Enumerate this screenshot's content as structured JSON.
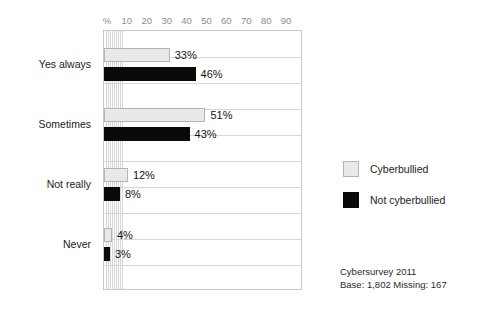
{
  "chart_data": {
    "type": "bar",
    "orientation": "horizontal",
    "title": "",
    "xlabel": "%",
    "ylabel": "",
    "xlim": [
      0,
      100
    ],
    "xticks": [
      "%",
      "10",
      "20",
      "30",
      "40",
      "50",
      "60",
      "70",
      "80",
      "90"
    ],
    "grid": true,
    "legend_position": "right",
    "categories": [
      "Yes always",
      "Sometimes",
      "Not really",
      "Never"
    ],
    "series": [
      {
        "name": "Cyberbullied",
        "color": "#e9e9e9",
        "values": [
          33,
          51,
          12,
          4
        ],
        "value_labels": [
          "33%",
          "51%",
          "12%",
          "4%"
        ]
      },
      {
        "name": "Not cyberbullied",
        "color": "#0a0a0a",
        "values": [
          46,
          43,
          8,
          3
        ],
        "value_labels": [
          "46%",
          "43%",
          "8%",
          "3%"
        ]
      }
    ],
    "annotations": {
      "source_line1": "Cybersurvey 2011",
      "source_line2": "Base: 1,802  Missing: 167"
    }
  }
}
